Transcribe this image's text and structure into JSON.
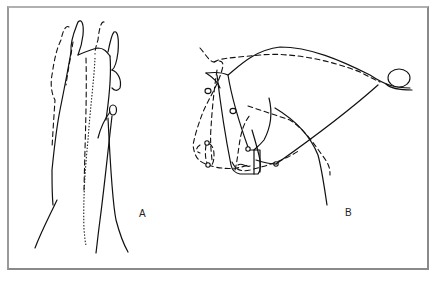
{
  "figure": {
    "type": "line-drawing",
    "panels": [
      {
        "id": "A",
        "label": "A",
        "view": "front/top view of head and neck, solid and dashed outlines"
      },
      {
        "id": "B",
        "label": "B",
        "view": "side view of head with bridle and rein, solid and dashed outlines"
      }
    ],
    "colors": {
      "line": "#111111",
      "frame": "#8a8a8a",
      "background": "#ffffff"
    }
  }
}
